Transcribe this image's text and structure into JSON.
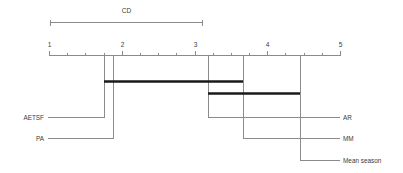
{
  "figure": {
    "type": "critical-difference-diagram",
    "cd_label": "CD",
    "background": "#ffffff",
    "axis_color": "#8b8b8b",
    "crossbar_color": "#1a1a1a",
    "text_color": "#3a3a3a"
  },
  "chart_data": {
    "type": "scatter",
    "subtype": "critical-difference-diagram",
    "title": "CD",
    "xlabel": "",
    "ylabel": "",
    "xlim": [
      1,
      5
    ],
    "grid": false,
    "legend": null,
    "axis": {
      "ticks": [
        1,
        2,
        3,
        4,
        5
      ],
      "tick_labels": [
        "1",
        "2",
        "3",
        "4",
        "5"
      ],
      "minor_ticks": [
        1.25,
        1.5,
        1.75,
        2.25,
        2.5,
        2.75,
        3.25,
        3.5,
        3.75,
        4.25,
        4.5,
        4.75
      ]
    },
    "critical_difference": {
      "label": "CD",
      "value": 2.12,
      "span_start": 1.0,
      "span_end": 3.12
    },
    "categories": [
      "AETSF",
      "PA",
      "AR",
      "MM",
      "Mean season"
    ],
    "values": [
      1.76,
      1.88,
      3.19,
      3.67,
      4.45
    ],
    "methods": [
      {
        "label": "AETSF",
        "rank": 1.76,
        "side": "left",
        "label_row": 0
      },
      {
        "label": "PA",
        "rank": 1.88,
        "side": "left",
        "label_row": 1
      },
      {
        "label": "AR",
        "rank": 3.19,
        "side": "right",
        "label_row": 0
      },
      {
        "label": "MM",
        "rank": 3.67,
        "side": "right",
        "label_row": 1
      },
      {
        "label": "Mean season",
        "rank": 4.45,
        "side": "right",
        "label_row": 2
      }
    ],
    "cliques": [
      {
        "start": 1.76,
        "end": 3.67,
        "members": [
          "AETSF",
          "PA",
          "AR",
          "MM"
        ]
      },
      {
        "start": 3.19,
        "end": 4.45,
        "members": [
          "AR",
          "MM",
          "Mean season"
        ]
      }
    ]
  }
}
